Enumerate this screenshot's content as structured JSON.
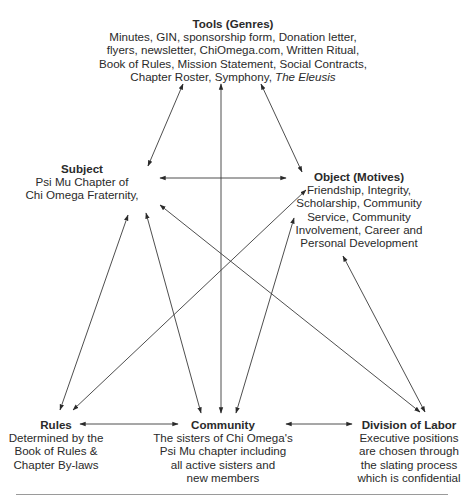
{
  "diagram": {
    "type": "activity-system-triangle",
    "nodes": {
      "tools": {
        "title": "Tools (Genres)",
        "lines": [
          "Minutes, GIN, sponsorship form, Donation letter,",
          "flyers, newsletter, ChiOmega.com, Written Ritual,",
          "Book of Rules, Mission Statement, Social Contracts,",
          "Chapter Roster, Symphony, "
        ],
        "italic_tail": "The Eleusis"
      },
      "subject": {
        "title": "Subject",
        "lines": [
          "Psi Mu Chapter of",
          "Chi Omega Fraternity,"
        ]
      },
      "object": {
        "title": "Object (Motives)",
        "lines": [
          "Friendship, Integrity,",
          "Scholarship, Community",
          "Service, Community",
          "Involvement, Career and",
          "Personal Development"
        ]
      },
      "rules": {
        "title": "Rules",
        "lines": [
          "Determined by the",
          "Book of Rules &",
          "Chapter By-laws"
        ]
      },
      "community": {
        "title": "Community",
        "lines": [
          "The sisters of Chi Omega's",
          "Psi Mu chapter including",
          "all active sisters and",
          "new members"
        ]
      },
      "division": {
        "title": "Division of Labor",
        "lines": [
          "Executive positions",
          "are chosen through",
          "the slating process",
          "which is confidential"
        ]
      }
    },
    "edges": [
      {
        "from": "tools",
        "to": "subject",
        "bidirectional": true
      },
      {
        "from": "tools",
        "to": "community",
        "bidirectional": true
      },
      {
        "from": "tools",
        "to": "object",
        "bidirectional": true
      },
      {
        "from": "subject",
        "to": "object",
        "bidirectional": true
      },
      {
        "from": "subject",
        "to": "rules",
        "bidirectional": true
      },
      {
        "from": "subject",
        "to": "community",
        "bidirectional": true
      },
      {
        "from": "subject",
        "to": "division",
        "bidirectional": true
      },
      {
        "from": "object",
        "to": "rules",
        "bidirectional": true
      },
      {
        "from": "object",
        "to": "community",
        "bidirectional": true
      },
      {
        "from": "object",
        "to": "division",
        "bidirectional": true
      },
      {
        "from": "rules",
        "to": "community",
        "bidirectional": true
      },
      {
        "from": "community",
        "to": "division",
        "bidirectional": true
      }
    ],
    "colors": {
      "line": "#3a3a3a",
      "text": "#2a2a2a",
      "rule": "#9a9a9a",
      "background": "#ffffff"
    }
  }
}
